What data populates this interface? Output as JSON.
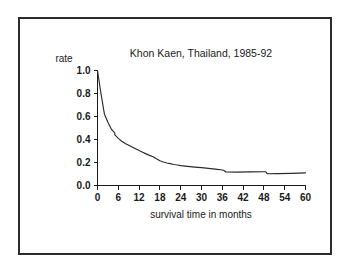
{
  "figure": {
    "background_color": "#ffffff",
    "frame_color": "#2b2b2b",
    "line_color": "#2a2a2a"
  },
  "chart_data": {
    "type": "line",
    "title": "Khon Kaen, Thailand, 1985-92",
    "xlabel": "survival time in months",
    "ylabel": "rate",
    "xlim": [
      0,
      60
    ],
    "ylim": [
      0.0,
      1.0
    ],
    "grid": false,
    "legend": null,
    "legend_position": "none",
    "x_tick_labels": [
      "0",
      "6",
      "12",
      "18",
      "24",
      "30",
      "36",
      "42",
      "48",
      "54",
      "60"
    ],
    "x_ticks": [
      0,
      6,
      12,
      18,
      24,
      30,
      36,
      42,
      48,
      54,
      60
    ],
    "y_tick_labels": [
      "0.0",
      "0.2",
      "0.4",
      "0.6",
      "0.8",
      "1.0"
    ],
    "y_ticks": [
      0.0,
      0.2,
      0.4,
      0.6,
      0.8,
      1.0
    ],
    "series": [
      {
        "name": "survival rate",
        "x": [
          0,
          1,
          2,
          3,
          4,
          5,
          5,
          6,
          7,
          8,
          9,
          10,
          11,
          12,
          13,
          14,
          15,
          16,
          17,
          18,
          19,
          20,
          21,
          22,
          23,
          24,
          26,
          28,
          30,
          32,
          34,
          36,
          36.5,
          37,
          40,
          44,
          48,
          48.5,
          49,
          52,
          56,
          60
        ],
        "y": [
          1.0,
          0.8,
          0.62,
          0.55,
          0.49,
          0.455,
          0.44,
          0.41,
          0.385,
          0.365,
          0.35,
          0.335,
          0.32,
          0.305,
          0.29,
          0.275,
          0.262,
          0.25,
          0.232,
          0.215,
          0.205,
          0.196,
          0.19,
          0.183,
          0.178,
          0.173,
          0.166,
          0.16,
          0.155,
          0.149,
          0.142,
          0.135,
          0.13,
          0.117,
          0.116,
          0.118,
          0.12,
          0.12,
          0.102,
          0.103,
          0.106,
          0.11
        ]
      }
    ]
  }
}
